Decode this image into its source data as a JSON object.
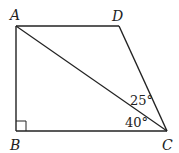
{
  "figure": {
    "type": "quadrilateral-geometry",
    "line_color": "#222222",
    "background": "#ffffff",
    "points": {
      "A": {
        "label": "A",
        "x": 16,
        "y": 26
      },
      "B": {
        "label": "B",
        "x": 16,
        "y": 131
      },
      "C": {
        "label": "C",
        "x": 167,
        "y": 131
      },
      "D": {
        "label": "D",
        "x": 119,
        "y": 26
      }
    },
    "segments": [
      "AB",
      "BC",
      "CD",
      "DA",
      "AC"
    ],
    "right_angle_at": "B",
    "angles": [
      {
        "vertex": "C",
        "between": "AC-DC",
        "label": "25°"
      },
      {
        "vertex": "C",
        "between": "BC-AC",
        "label": "40°"
      }
    ]
  }
}
